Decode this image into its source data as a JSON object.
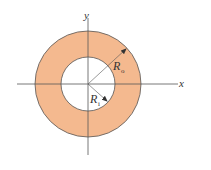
{
  "diagram": {
    "type": "annulus",
    "fill_color": "#f4b98f",
    "stroke_color": "#555555",
    "axis_color": "#555555",
    "labels": {
      "x_axis": "x",
      "y_axis": "y",
      "outer_radius_main": "R",
      "outer_radius_sub": "o",
      "inner_radius_main": "R",
      "inner_radius_sub": "i"
    }
  }
}
